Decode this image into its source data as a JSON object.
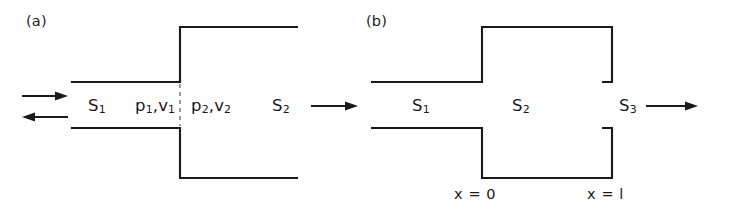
{
  "figure": {
    "background_color": "#ffffff",
    "line_color": "#1a1a1a",
    "text_color": "#1a1a1a"
  },
  "panel_a": {
    "tag": "(a)",
    "arrows": [
      {
        "name": "incident-wave-arrow",
        "direction": "right"
      },
      {
        "name": "reflected-wave-arrow",
        "direction": "left"
      },
      {
        "name": "transmitted-wave-arrow",
        "direction": "right"
      }
    ],
    "labels": {
      "section_1": {
        "symbol": "S",
        "subscript": "1"
      },
      "section_2": {
        "symbol": "S",
        "subscript": "2"
      },
      "state_1_p": {
        "symbol": "p",
        "subscript": "1"
      },
      "state_1_v": {
        "symbol": "v",
        "subscript": "1"
      },
      "state_1_separator": ",",
      "state_2_p": {
        "symbol": "p",
        "subscript": "2"
      },
      "state_2_v": {
        "symbol": "v",
        "subscript": "2"
      },
      "state_2_separator": ","
    },
    "geometry": {
      "narrow_duct_top_y": 82,
      "narrow_duct_bottom_y": 128,
      "wide_duct_top_y": 27,
      "wide_duct_bottom_y": 178,
      "junction_x": 180,
      "narrow_left_x": 72,
      "wide_right_x": 297,
      "dashed_interface": true
    }
  },
  "panel_b": {
    "tag": "(b)",
    "arrows": [
      {
        "name": "incident-wave-arrow",
        "direction": "right"
      },
      {
        "name": "reflected-wave-arrow",
        "direction": "left"
      },
      {
        "name": "transmitted-wave-arrow",
        "direction": "right"
      }
    ],
    "labels": {
      "section_1": {
        "symbol": "S",
        "subscript": "1"
      },
      "section_2": {
        "symbol": "S",
        "subscript": "2"
      },
      "section_3": {
        "symbol": "S",
        "subscript": "3"
      },
      "position_start": "x = 0",
      "position_end": "x = l"
    },
    "geometry": {
      "narrow_duct_top_y": 82,
      "narrow_duct_bottom_y": 128,
      "wide_duct_top_y": 27,
      "wide_duct_bottom_y": 178,
      "step_in_x": 114,
      "step_out_x": 244,
      "left_x": 4,
      "right_x": 235
    }
  }
}
